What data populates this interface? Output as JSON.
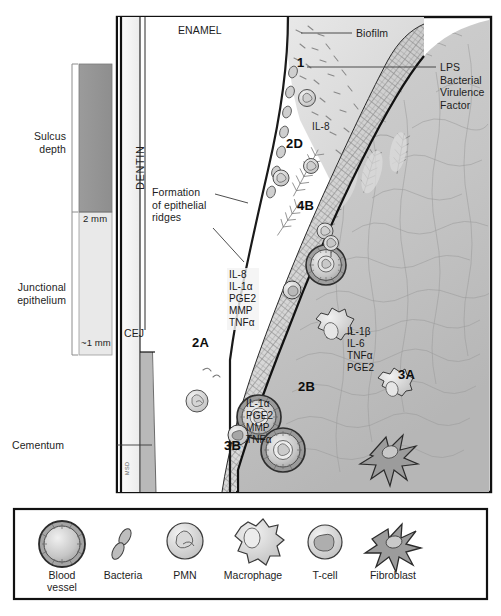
{
  "figure": {
    "tooth_labels": {
      "enamel": "ENAMEL",
      "dentin": "DENTIN",
      "cej": "CEJ"
    },
    "attribution": "MSD"
  },
  "scale": {
    "sulcus_label": "Sulcus\ndepth",
    "junctional_label": "Junctional\nepithelium",
    "tick_top": "2 mm",
    "tick_bottom": "~1 mm"
  },
  "callouts": {
    "biofilm": "Biofilm",
    "lps": "LPS\nBacterial\nVirulence\nFactor",
    "ridges": "Formation\nof epithelial\nridges",
    "cementum": "Cementum"
  },
  "markers": {
    "m1": "1",
    "m2d": "2D",
    "m4b": "4B",
    "m2a": "2A",
    "m2b": "2B",
    "m3b": "3B",
    "m3a": "3A"
  },
  "mediators": {
    "il8_epithelial": "IL-8",
    "group_epithelial": [
      "IL-8",
      "IL-1α",
      "PGE2",
      "MMP",
      "TNFα"
    ],
    "group_vessel": [
      "IL-1α",
      "PGE2",
      "MMP",
      "TNFα"
    ],
    "group_connective": [
      "IL-1β",
      "IL-6",
      "TNFα",
      "PGE2"
    ]
  },
  "legend": {
    "items": [
      {
        "icon": "blood-vessel-icon",
        "label": "Blood\nvessel"
      },
      {
        "icon": "bacteria-icon",
        "label": "Bacteria"
      },
      {
        "icon": "pmn-icon",
        "label": "PMN"
      },
      {
        "icon": "macrophage-icon",
        "label": "Macrophage"
      },
      {
        "icon": "t-cell-icon",
        "label": "T-cell"
      },
      {
        "icon": "fibroblast-icon",
        "label": "Fibroblast"
      }
    ]
  },
  "colors": {
    "frame": "#111111",
    "enamel": "#ffffff",
    "dentin": "#f2f2f2",
    "cementum": "#b9b9b9",
    "connective_tissue": "#c8c8c8",
    "epithelium": "#d6d6d6",
    "biofilm": "#dcdcdc",
    "scale_fill_top": "#9a9a9a",
    "scale_fill_bottom": "#e6e6e6"
  }
}
